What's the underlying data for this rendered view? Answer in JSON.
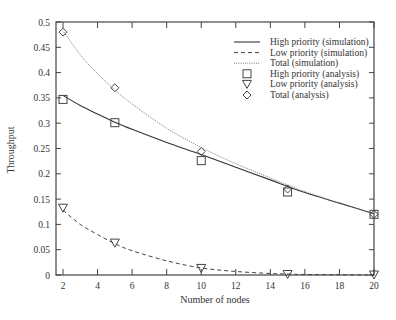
{
  "chart_data": {
    "type": "line",
    "title": "",
    "xlabel": "Number of nodes",
    "ylabel": "Throughput",
    "xlim": [
      1.6,
      20
    ],
    "ylim": [
      0,
      0.5
    ],
    "x_ticks": [
      2,
      4,
      6,
      8,
      10,
      12,
      14,
      16,
      18,
      20
    ],
    "y_ticks": [
      0,
      0.05,
      0.1,
      0.15,
      0.2,
      0.25,
      0.3,
      0.35,
      0.4,
      0.45,
      0.5
    ],
    "x_tick_labels": [
      "2",
      "4",
      "6",
      "8",
      "10",
      "12",
      "14",
      "16",
      "18",
      "20"
    ],
    "y_tick_labels": [
      "0",
      "0.05",
      "0.1",
      "0.15",
      "0.2",
      "0.25",
      "0.3",
      "0.35",
      "0.4",
      "0.45",
      "0.5"
    ],
    "grid": false,
    "legend_position": "upper right",
    "series": [
      {
        "name": "High priority (simulation)",
        "style": "solid",
        "color": "#333333",
        "x": [
          2,
          3,
          4,
          5,
          6,
          8,
          10,
          12,
          14,
          15,
          16,
          18,
          20
        ],
        "values": [
          0.355,
          0.335,
          0.318,
          0.302,
          0.288,
          0.262,
          0.238,
          0.213,
          0.188,
          0.175,
          0.163,
          0.142,
          0.121
        ]
      },
      {
        "name": "Low priority (simulation)",
        "style": "dashed",
        "color": "#444444",
        "x": [
          2,
          3,
          4,
          5,
          6,
          8,
          10,
          12,
          14,
          15,
          16,
          18,
          20
        ],
        "values": [
          0.128,
          0.1,
          0.08,
          0.062,
          0.048,
          0.028,
          0.014,
          0.007,
          0.003,
          0.002,
          0.001,
          0.0005,
          0.0
        ]
      },
      {
        "name": "Total (simulation)",
        "style": "dotted",
        "color": "#888888",
        "x": [
          2,
          3,
          4,
          5,
          6,
          8,
          10,
          12,
          14,
          15,
          16,
          18,
          20
        ],
        "values": [
          0.483,
          0.435,
          0.398,
          0.366,
          0.338,
          0.29,
          0.252,
          0.22,
          0.192,
          0.178,
          0.165,
          0.142,
          0.121
        ]
      },
      {
        "name": "High priority (analysis)",
        "marker": "square",
        "x": [
          2,
          5,
          10,
          15,
          20
        ],
        "values": [
          0.347,
          0.301,
          0.226,
          0.164,
          0.12
        ]
      },
      {
        "name": "Low priority (analysis)",
        "marker": "triangle-down",
        "x": [
          2,
          5,
          10,
          15,
          20
        ],
        "values": [
          0.132,
          0.063,
          0.013,
          0.001,
          0.0
        ]
      },
      {
        "name": "Total (analysis)",
        "marker": "diamond",
        "x": [
          2,
          5,
          10,
          15,
          20
        ],
        "values": [
          0.48,
          0.37,
          0.244,
          0.17,
          0.12
        ]
      }
    ]
  }
}
